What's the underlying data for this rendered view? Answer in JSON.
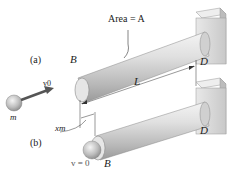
{
  "figure": {
    "labels": {
      "area": "Area = A",
      "part_a": "(a)",
      "part_b": "(b)",
      "point_B_top": "B",
      "point_D_top": "D",
      "point_B_bottom": "B",
      "point_D_bottom": "D",
      "velocity_initial": "v0",
      "velocity_final": "v = 0",
      "mass": "m",
      "length": "L",
      "deflection": "xm"
    },
    "colors": {
      "rod": "#c8c8c8",
      "wall": "#dcdcdc",
      "ball": "#b0b0b0",
      "arrow": "#555555",
      "text": "#222222"
    }
  }
}
